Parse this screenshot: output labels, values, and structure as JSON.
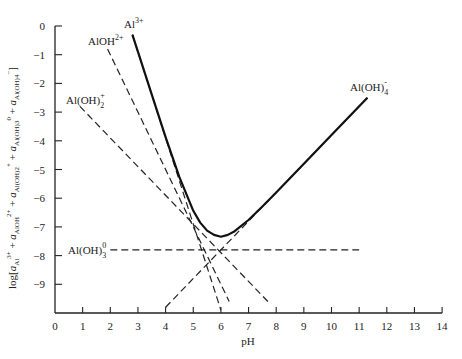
{
  "chart_data": {
    "type": "line",
    "title": "",
    "xlabel": "pH",
    "ylabel": "log[a_Al3+ + a_AlOH2+ + a_Al(OH)2+ + a_Al(OH)3^0 + a_Al(OH)4-]",
    "xlim": [
      0,
      14
    ],
    "ylim": [
      -10,
      0
    ],
    "grid": false,
    "x_ticks": [
      0,
      1,
      2,
      3,
      4,
      5,
      6,
      7,
      8,
      9,
      10,
      11,
      12,
      13,
      14
    ],
    "y_ticks": [
      0,
      -1,
      -2,
      -3,
      -4,
      -5,
      -6,
      -7,
      -8,
      -9
    ],
    "series": [
      {
        "name": "Al3+",
        "label_main": "Al",
        "label_sup": "3+",
        "label_sub": "",
        "style": "solid-then-dashed",
        "points": [
          [
            2.8,
            -0.3
          ],
          [
            6.0,
            -9.9
          ]
        ]
      },
      {
        "name": "AlOH2+",
        "label_main": "AlOH",
        "label_sup": "2+",
        "label_sub": "",
        "style": "dashed",
        "points": [
          [
            1.9,
            -0.8
          ],
          [
            6.3,
            -9.6
          ]
        ]
      },
      {
        "name": "Al(OH)2+",
        "label_main": "Al(OH)",
        "label_sup": "+",
        "label_sub": "2",
        "style": "dashed",
        "points": [
          [
            0.9,
            -2.8
          ],
          [
            7.7,
            -9.6
          ]
        ]
      },
      {
        "name": "Al(OH)3^0",
        "label_main": "Al(OH)",
        "label_sup": "0",
        "label_sub": "3",
        "style": "dashed",
        "points": [
          [
            2.0,
            -7.8
          ],
          [
            11.0,
            -7.8
          ]
        ]
      },
      {
        "name": "Al(OH)4-",
        "label_main": "Al(OH)",
        "label_sup": "-",
        "label_sub": "4",
        "style": "dashed",
        "points": [
          [
            4.0,
            -9.8
          ],
          [
            11.3,
            -2.5
          ]
        ]
      }
    ],
    "total_curve": {
      "name": "Total dissolved Al",
      "style": "solid",
      "points": [
        [
          2.8,
          -0.3
        ],
        [
          3.5,
          -2.39
        ],
        [
          4.0,
          -3.87
        ],
        [
          4.5,
          -5.27
        ],
        [
          5.0,
          -6.44
        ],
        [
          5.25,
          -6.85
        ],
        [
          5.5,
          -7.13
        ],
        [
          5.75,
          -7.28
        ],
        [
          6.0,
          -7.34
        ],
        [
          6.25,
          -7.28
        ],
        [
          6.5,
          -7.15
        ],
        [
          7.0,
          -6.76
        ],
        [
          7.5,
          -6.29
        ],
        [
          8.0,
          -5.8
        ],
        [
          9.0,
          -4.8
        ],
        [
          10.0,
          -3.8
        ],
        [
          11.3,
          -2.5
        ]
      ]
    }
  }
}
